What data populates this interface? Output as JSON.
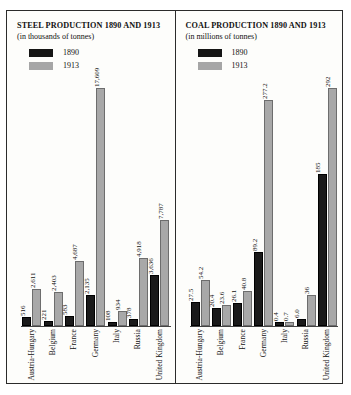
{
  "legend": {
    "series_a": "1890",
    "series_b": "1913",
    "color_a": "#1a1a1a",
    "color_b": "#a8a8a8"
  },
  "charts": [
    {
      "title": "STEEL PRODUCTION 1890 AND 1913",
      "subtitle": "(in thousands of tonnes)"
    },
    {
      "title": "COAL PRODUCTION 1890 AND 1913",
      "subtitle": "(in millions of tonnes)"
    }
  ],
  "chart_data": [
    {
      "type": "bar",
      "title": "STEEL PRODUCTION 1890 AND 1913",
      "subtitle": "(in thousands of tonnes)",
      "xlabel": "",
      "ylabel": "thousands of tonnes",
      "grid": false,
      "legend_position": "top-left",
      "categories": [
        "Austria-Hungary",
        "Belgium",
        "France",
        "Germany",
        "Italy",
        "Russia",
        "United Kingdom"
      ],
      "series": [
        {
          "name": "1890",
          "values": [
            516,
            221,
            583,
            2135,
            108,
            378,
            3636
          ],
          "labels": [
            "516",
            "221",
            "583",
            "2,135",
            "108",
            "378",
            "3,636"
          ]
        },
        {
          "name": "1913",
          "values": [
            2611,
            2403,
            4687,
            17609,
            934,
            4918,
            7787
          ],
          "labels": [
            "2,611",
            "2,403",
            "4,687",
            "17,609",
            "934",
            "4,918",
            "7,787"
          ]
        }
      ],
      "ylim": [
        0,
        17609
      ]
    },
    {
      "type": "bar",
      "title": "COAL PRODUCTION 1890 AND 1913",
      "subtitle": "(in millions of tonnes)",
      "xlabel": "",
      "ylabel": "millions of tonnes",
      "grid": false,
      "legend_position": "top-left",
      "categories": [
        "Austria-Hungary",
        "Belgium",
        "France",
        "Germany",
        "Italy",
        "Russia",
        "United Kingdom"
      ],
      "series": [
        {
          "name": "1890",
          "values": [
            27.5,
            20.4,
            26.1,
            89.2,
            0.4,
            6.0,
            185
          ],
          "labels": [
            "27.5",
            "20.4",
            "26.1",
            "89.2",
            "0.4",
            "6.0",
            "185"
          ]
        },
        {
          "name": "1913",
          "values": [
            54.2,
            23.6,
            40.8,
            277.2,
            0.7,
            36,
            292
          ],
          "labels": [
            "54.2",
            "23.6",
            "40.8",
            "277.2",
            "0.7",
            "36",
            "292"
          ]
        }
      ],
      "ylim": [
        0,
        292
      ]
    }
  ]
}
